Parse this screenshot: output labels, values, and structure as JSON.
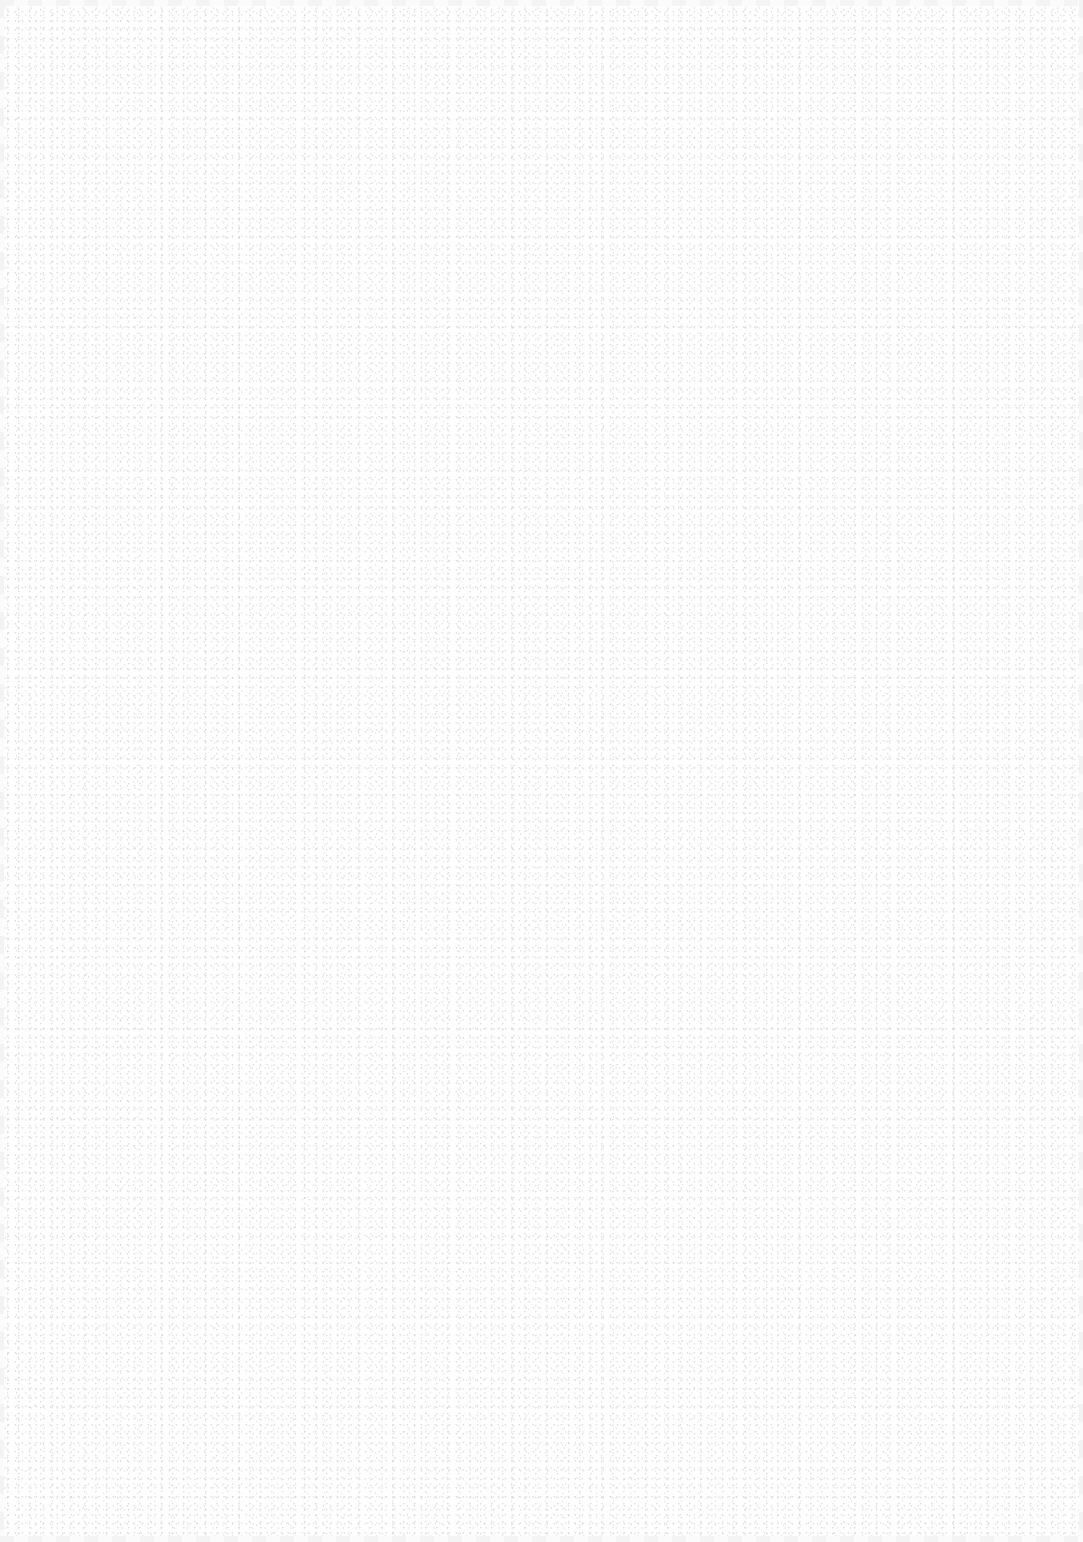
{
  "page": {
    "background_color": "#fefefe",
    "texture": "paper-speckle",
    "content": []
  }
}
